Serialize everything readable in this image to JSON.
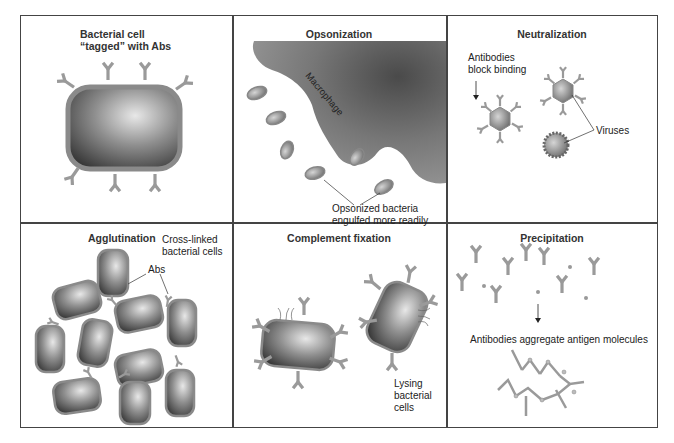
{
  "panels": [
    {
      "id": "tagged",
      "title_line1": "Bacterial cell",
      "title_line2": "“tagged” with Abs"
    },
    {
      "id": "opsonization",
      "title": "Opsonization",
      "labels": {
        "macrophage": "Macrophage",
        "note_line1": "Opsonized bacteria",
        "note_line2": "engulfed more readily"
      }
    },
    {
      "id": "neutralization",
      "title": "Neutralization",
      "labels": {
        "block_line1": "Antibodies",
        "block_line2": "block binding",
        "viruses": "Viruses"
      }
    },
    {
      "id": "agglutination",
      "title": "Agglutination",
      "labels": {
        "crosslinked_line1": "Cross-linked",
        "crosslinked_line2": "bacterial cells",
        "abs": "Abs"
      }
    },
    {
      "id": "complement",
      "title": "Complement fixation",
      "labels": {
        "lysing_line1": "Lysing",
        "lysing_line2": "bacterial",
        "lysing_line3": "cells"
      }
    },
    {
      "id": "precipitation",
      "title": "Precipitation",
      "labels": {
        "aggregate": "Antibodies aggregate antigen molecules"
      }
    }
  ],
  "colors": {
    "border": "#444444",
    "antibody": "#9a9a9a",
    "cell_dark": "#3a3a3a",
    "cell_light": "#d8d8d8",
    "membrane": "#8a8a8a",
    "macrophage": "#7a7a7a"
  }
}
